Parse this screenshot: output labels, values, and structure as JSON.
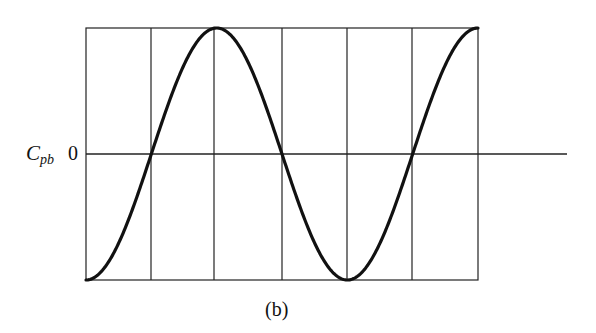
{
  "chart_data": {
    "type": "line",
    "title": "",
    "caption": "(b)",
    "ylabel": "C",
    "ylabel_sub": "pb",
    "ytick_labels": [
      "0"
    ],
    "xlabel": "",
    "grid": {
      "vertical_lines": 7,
      "horizontal_zero_line": true
    },
    "frame": {
      "left_px": 86,
      "right_px": 478,
      "top_px": 28,
      "bottom_px": 280,
      "zero_px": 154
    },
    "gridlines_x_px": [
      86,
      151,
      214,
      282,
      347,
      412,
      478
    ],
    "series": [
      {
        "name": "Cpb",
        "description": "Sinusoidal curve: starts at minimum, rises through zero to maximum, falls through zero to minimum, rises through zero to maximum",
        "x": [
          0,
          1,
          2,
          3,
          4,
          5,
          6
        ],
        "values": [
          -1,
          0,
          1,
          0,
          -1,
          0,
          1
        ]
      }
    ],
    "ylim": [
      -1,
      1
    ],
    "xlim": [
      0,
      6
    ]
  },
  "labels": {
    "ylabel_main": "C",
    "ylabel_sub": "pb",
    "zero": "0",
    "caption": "(b)"
  },
  "style": {
    "line_color": "#111111",
    "grid_color": "#222222"
  }
}
